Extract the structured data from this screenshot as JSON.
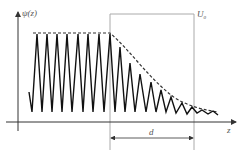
{
  "diagram": {
    "y_axis_label": "ψ(z)",
    "x_axis_label": "z",
    "barrier_label": "U",
    "barrier_label_sub": "0",
    "width_label": "d",
    "colors": {
      "wave": "#111111",
      "envelope": "#333333",
      "axes": "#333333",
      "barrier": "#999999"
    }
  }
}
